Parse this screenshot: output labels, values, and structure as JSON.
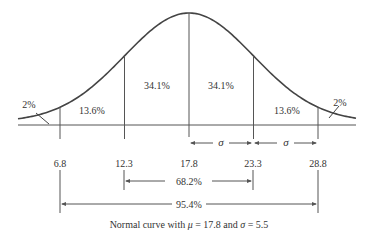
{
  "diagram": {
    "type": "normal-curve",
    "mean": 17.8,
    "sd": 5.5,
    "caption_prefix": "Normal curve with ",
    "caption_mu": "μ",
    "caption_mid": " = 17.8 and ",
    "caption_sigma": "σ",
    "caption_end": " = 5.5",
    "tick_labels": [
      "6.8",
      "12.3",
      "17.8",
      "23.3",
      "28.8"
    ],
    "tick_values": [
      6.8,
      12.3,
      17.8,
      23.3,
      28.8
    ],
    "region_labels": {
      "left_tail": "2%",
      "left_outer": "13.6%",
      "left_inner": "34.1%",
      "right_inner": "34.1%",
      "right_outer": "13.6%",
      "right_tail": "2%"
    },
    "sigma_symbol": "σ",
    "range_1sd": "68.2%",
    "range_2sd": "95.4%"
  },
  "colors": {
    "line": "#555555",
    "curve": "#444444",
    "text": "#333333",
    "background": "#ffffff"
  }
}
